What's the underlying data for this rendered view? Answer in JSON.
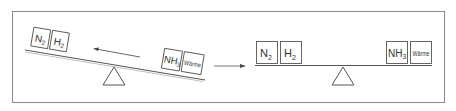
{
  "left_balance": {
    "left_boxes": [
      {
        "main": "N",
        "sub": "2"
      },
      {
        "main": "H",
        "sub": "2"
      }
    ],
    "right_boxes": [
      {
        "main": "NH",
        "sub": "3"
      },
      {
        "main": "Wärme",
        "sub": ""
      }
    ],
    "arrow_direction": "left"
  },
  "transition_arrow_direction": "right",
  "right_balance": {
    "left_boxes": [
      {
        "main": "N",
        "sub": "2"
      },
      {
        "main": "H",
        "sub": "2"
      }
    ],
    "right_boxes": [
      {
        "main": "NH",
        "sub": "3"
      },
      {
        "main": "Wärme",
        "sub": ""
      }
    ]
  },
  "colors": {
    "line": "#555555",
    "text": "#333333",
    "frame": "#888888"
  }
}
